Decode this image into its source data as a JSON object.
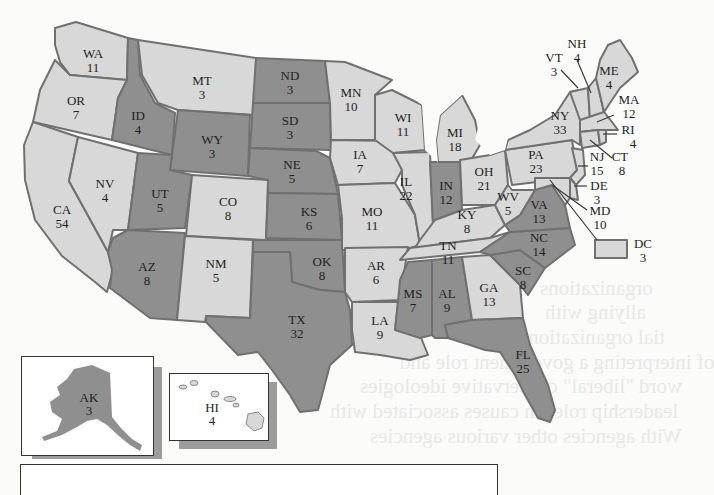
{
  "map": {
    "title": "Electoral votes by state",
    "colors": {
      "light": "#d8d8d8",
      "dark": "#8f8f8f",
      "border": "#707070"
    },
    "states": [
      {
        "abbr": "WA",
        "votes": "11",
        "shade": "light"
      },
      {
        "abbr": "OR",
        "votes": "7",
        "shade": "light"
      },
      {
        "abbr": "CA",
        "votes": "54",
        "shade": "light"
      },
      {
        "abbr": "NV",
        "votes": "4",
        "shade": "light"
      },
      {
        "abbr": "ID",
        "votes": "4",
        "shade": "dark"
      },
      {
        "abbr": "MT",
        "votes": "3",
        "shade": "light"
      },
      {
        "abbr": "WY",
        "votes": "3",
        "shade": "dark"
      },
      {
        "abbr": "UT",
        "votes": "5",
        "shade": "dark"
      },
      {
        "abbr": "CO",
        "votes": "8",
        "shade": "light"
      },
      {
        "abbr": "AZ",
        "votes": "8",
        "shade": "dark"
      },
      {
        "abbr": "NM",
        "votes": "5",
        "shade": "light"
      },
      {
        "abbr": "ND",
        "votes": "3",
        "shade": "dark"
      },
      {
        "abbr": "SD",
        "votes": "3",
        "shade": "dark"
      },
      {
        "abbr": "NE",
        "votes": "5",
        "shade": "dark"
      },
      {
        "abbr": "KS",
        "votes": "6",
        "shade": "dark"
      },
      {
        "abbr": "OK",
        "votes": "8",
        "shade": "dark"
      },
      {
        "abbr": "TX",
        "votes": "32",
        "shade": "dark"
      },
      {
        "abbr": "MN",
        "votes": "10",
        "shade": "light"
      },
      {
        "abbr": "IA",
        "votes": "7",
        "shade": "light"
      },
      {
        "abbr": "MO",
        "votes": "11",
        "shade": "light"
      },
      {
        "abbr": "AR",
        "votes": "6",
        "shade": "light"
      },
      {
        "abbr": "LA",
        "votes": "9",
        "shade": "light"
      },
      {
        "abbr": "WI",
        "votes": "11",
        "shade": "light"
      },
      {
        "abbr": "IL",
        "votes": "22",
        "shade": "light"
      },
      {
        "abbr": "MI",
        "votes": "18",
        "shade": "light"
      },
      {
        "abbr": "IN",
        "votes": "12",
        "shade": "dark"
      },
      {
        "abbr": "OH",
        "votes": "21",
        "shade": "light"
      },
      {
        "abbr": "KY",
        "votes": "8",
        "shade": "light"
      },
      {
        "abbr": "TN",
        "votes": "11",
        "shade": "light"
      },
      {
        "abbr": "MS",
        "votes": "7",
        "shade": "dark"
      },
      {
        "abbr": "AL",
        "votes": "9",
        "shade": "dark"
      },
      {
        "abbr": "GA",
        "votes": "13",
        "shade": "light"
      },
      {
        "abbr": "FL",
        "votes": "25",
        "shade": "dark"
      },
      {
        "abbr": "SC",
        "votes": "8",
        "shade": "dark"
      },
      {
        "abbr": "NC",
        "votes": "14",
        "shade": "dark"
      },
      {
        "abbr": "VA",
        "votes": "13",
        "shade": "dark"
      },
      {
        "abbr": "WV",
        "votes": "5",
        "shade": "light"
      },
      {
        "abbr": "PA",
        "votes": "23",
        "shade": "light"
      },
      {
        "abbr": "NY",
        "votes": "33",
        "shade": "light"
      },
      {
        "abbr": "VT",
        "votes": "3",
        "shade": "light"
      },
      {
        "abbr": "NH",
        "votes": "4",
        "shade": "light"
      },
      {
        "abbr": "ME",
        "votes": "4",
        "shade": "light"
      },
      {
        "abbr": "MA",
        "votes": "12",
        "shade": "light"
      },
      {
        "abbr": "RI",
        "votes": "4",
        "shade": "light"
      },
      {
        "abbr": "CT",
        "votes": "8",
        "shade": "light"
      },
      {
        "abbr": "NJ",
        "votes": "15",
        "shade": "light"
      },
      {
        "abbr": "DE",
        "votes": "3",
        "shade": "light"
      },
      {
        "abbr": "MD",
        "votes": "10",
        "shade": "light"
      },
      {
        "abbr": "DC",
        "votes": "3",
        "shade": "light"
      },
      {
        "abbr": "AK",
        "votes": "3",
        "shade": "dark"
      },
      {
        "abbr": "HI",
        "votes": "4",
        "shade": "light"
      }
    ]
  }
}
